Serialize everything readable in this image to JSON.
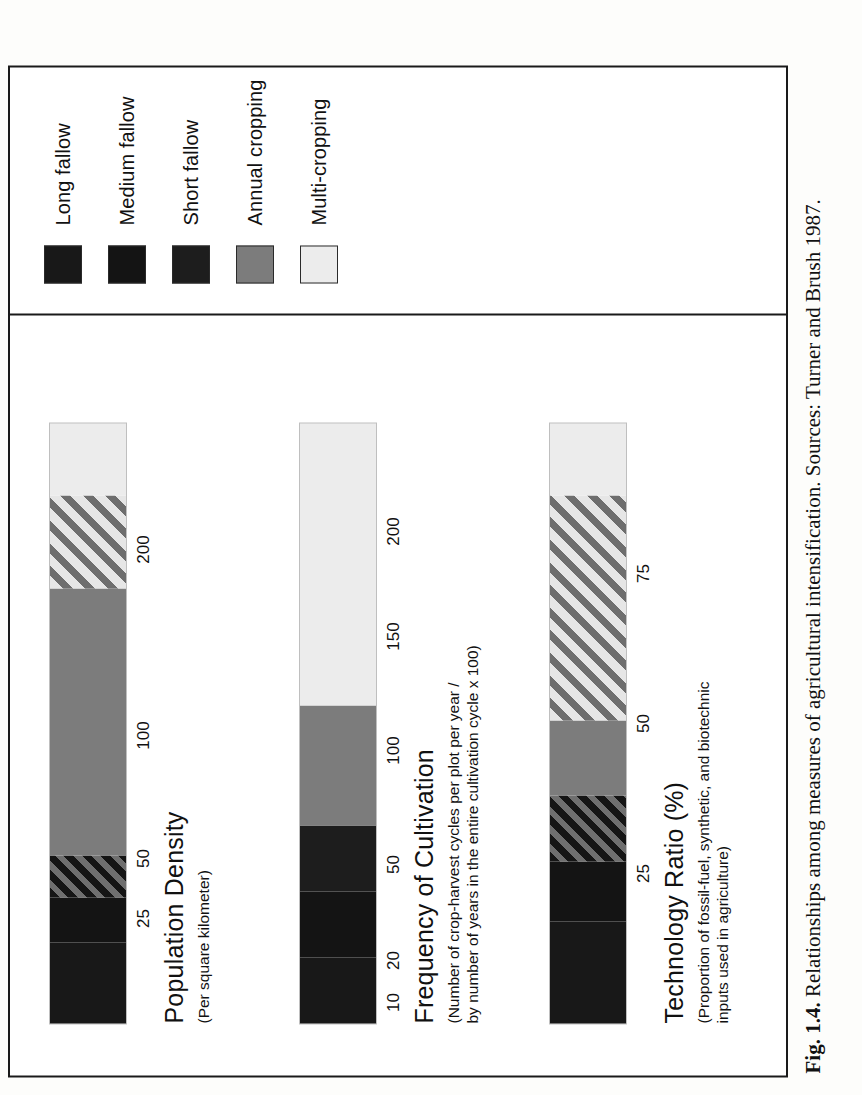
{
  "figure": {
    "caption_label": "Fig. 1.4.",
    "caption_text": "Relationships among measures of agricultural intensification. Sources: Turner and Brush 1987."
  },
  "legend": {
    "items": [
      {
        "label": "Long fallow",
        "fill": "f-black",
        "color": "#181818"
      },
      {
        "label": "Medium fallow",
        "fill": "f-black2",
        "color": "#141414"
      },
      {
        "label": "Short fallow",
        "fill": "f-black3",
        "color": "#1d1d1d"
      },
      {
        "label": "Annual cropping",
        "fill": "f-gray",
        "color": "#7c7c7c"
      },
      {
        "label": "Multi-cropping",
        "fill": "f-verylight",
        "color": "#ececec"
      }
    ]
  },
  "chart_data": {
    "type": "bar",
    "orientation": "horizontal-stacked",
    "title": "Relationships among measures of agricultural intensification",
    "grid": false,
    "legend_position": "right",
    "legend_entries": [
      "Long fallow",
      "Medium fallow",
      "Short fallow",
      "Annual cropping",
      "Multi-cropping"
    ],
    "series": [
      {
        "name": "Population Density",
        "sublabel_lines": [
          "(Per square kilometer)"
        ],
        "xlabel": "Persons per square kilometer",
        "scale": "log-like",
        "ticks": [
          {
            "label": "25",
            "value": 25,
            "pos_pct": 17.5
          },
          {
            "label": "50",
            "value": 50,
            "pos_pct": 27.5
          },
          {
            "label": "100",
            "value": 100,
            "pos_pct": 48.0
          },
          {
            "label": "200",
            "value": 200,
            "pos_pct": 79.0
          }
        ],
        "segments": [
          {
            "category": "Long fallow",
            "fill": "f-black",
            "start_pct": 0.0,
            "end_pct": 13.5
          },
          {
            "category": "Medium fallow",
            "fill": "f-black2",
            "start_pct": 13.5,
            "end_pct": 21.0
          },
          {
            "category": "Short fallow",
            "fill": "f-darkhatch",
            "start_pct": 21.0,
            "end_pct": 28.0
          },
          {
            "category": "Annual cropping",
            "fill": "f-gray",
            "start_pct": 28.0,
            "end_pct": 72.5
          },
          {
            "category": "Multi-cropping",
            "fill": "f-lighthatch",
            "start_pct": 72.5,
            "end_pct": 88.0
          },
          {
            "category": "Multi-cropping",
            "fill": "f-verylight",
            "start_pct": 88.0,
            "end_pct": 100.0
          }
        ]
      },
      {
        "name": "Frequency of Cultivation",
        "sublabel_lines": [
          "(Number of crop-harvest cycles per plot per year /",
          "by number of years in the entire cultivation cycle x 100)"
        ],
        "xlabel": "Cultivation frequency index",
        "scale": "log-like",
        "ticks": [
          {
            "label": "10",
            "value": 10,
            "pos_pct": 3.5
          },
          {
            "label": "20",
            "value": 20,
            "pos_pct": 10.5
          },
          {
            "label": "50",
            "value": 50,
            "pos_pct": 26.5
          },
          {
            "label": "100",
            "value": 100,
            "pos_pct": 45.5
          },
          {
            "label": "150",
            "value": 150,
            "pos_pct": 64.5
          },
          {
            "label": "200",
            "value": 200,
            "pos_pct": 82.0
          }
        ],
        "segments": [
          {
            "category": "Long fallow",
            "fill": "f-black",
            "start_pct": 0.0,
            "end_pct": 11.0
          },
          {
            "category": "Medium fallow",
            "fill": "f-black2",
            "start_pct": 11.0,
            "end_pct": 22.0
          },
          {
            "category": "Short fallow",
            "fill": "f-black3",
            "start_pct": 22.0,
            "end_pct": 33.0
          },
          {
            "category": "Annual cropping",
            "fill": "f-gray",
            "start_pct": 33.0,
            "end_pct": 53.0
          },
          {
            "category": "Multi-cropping",
            "fill": "f-verylight",
            "start_pct": 53.0,
            "end_pct": 100.0
          }
        ]
      },
      {
        "name": "Technology Ratio (%)",
        "sublabel_lines": [
          "(Proportion of fossil-fuel, synthetic, and biotechnic",
          "inputs used in agriculture)"
        ],
        "xlabel": "Percent",
        "scale": "linear",
        "ticks": [
          {
            "label": "25",
            "value": 25,
            "pos_pct": 25.0
          },
          {
            "label": "50",
            "value": 50,
            "pos_pct": 50.0
          },
          {
            "label": "75",
            "value": 75,
            "pos_pct": 75.0
          }
        ],
        "segments": [
          {
            "category": "Long fallow",
            "fill": "f-black",
            "start_pct": 0.0,
            "end_pct": 17.0
          },
          {
            "category": "Medium fallow",
            "fill": "f-black2",
            "start_pct": 17.0,
            "end_pct": 27.0
          },
          {
            "category": "Short fallow",
            "fill": "f-darkhatch",
            "start_pct": 27.0,
            "end_pct": 38.0
          },
          {
            "category": "Annual cropping",
            "fill": "f-gray",
            "start_pct": 38.0,
            "end_pct": 50.5
          },
          {
            "category": "Multi-cropping",
            "fill": "f-lighthatch",
            "start_pct": 50.5,
            "end_pct": 88.0
          },
          {
            "category": "Multi-cropping",
            "fill": "f-verylight",
            "start_pct": 88.0,
            "end_pct": 100.0
          }
        ]
      }
    ]
  }
}
